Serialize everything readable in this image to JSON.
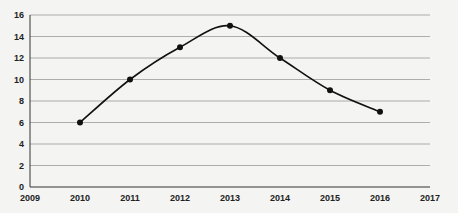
{
  "chart_data": {
    "type": "line",
    "title": "",
    "xlabel": "",
    "ylabel": "",
    "x": [
      2010,
      2011,
      2012,
      2013,
      2014,
      2015,
      2016
    ],
    "series": [
      {
        "name": "Series 1",
        "values": [
          6,
          10,
          13,
          15,
          12,
          9,
          7
        ]
      }
    ],
    "xlim": [
      2009,
      2017
    ],
    "ylim": [
      0,
      16
    ],
    "x_ticks": [
      "2009",
      "2010",
      "2011",
      "2012",
      "2013",
      "2014",
      "2015",
      "2016",
      "2017"
    ],
    "y_ticks": [
      "0",
      "2",
      "4",
      "6",
      "8",
      "10",
      "12",
      "14",
      "16"
    ],
    "grid": true,
    "smoothed": true,
    "markers": true,
    "legend": null,
    "colors": {
      "line": "#111111",
      "grid": "#9a9a9a",
      "background": "#f4f4f2"
    }
  }
}
